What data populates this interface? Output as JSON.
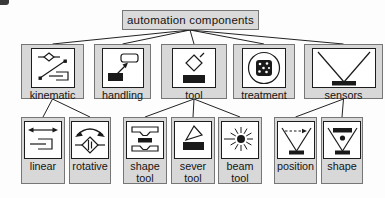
{
  "diagram": {
    "root": {
      "label": "automation components"
    },
    "level1": [
      {
        "id": "kinematic",
        "label": "kinematic",
        "icon": "kinematic-icon"
      },
      {
        "id": "handling",
        "label": "handling",
        "icon": "handling-icon"
      },
      {
        "id": "tool",
        "label": "tool",
        "icon": "tool-icon"
      },
      {
        "id": "treatment",
        "label": "treatment",
        "icon": "treatment-icon"
      },
      {
        "id": "sensors",
        "label": "sensors",
        "icon": "sensors-icon"
      }
    ],
    "level2": [
      {
        "id": "linear",
        "label": "linear",
        "parent": "kinematic",
        "icon": "linear-icon"
      },
      {
        "id": "rotative",
        "label": "rotative",
        "parent": "kinematic",
        "icon": "rotative-icon"
      },
      {
        "id": "shape-tool",
        "label": "shape tool",
        "parent": "tool",
        "icon": "shape-tool-icon"
      },
      {
        "id": "sever-tool",
        "label": "sever tool",
        "parent": "tool",
        "icon": "sever-tool-icon"
      },
      {
        "id": "beam-tool",
        "label": "beam tool",
        "parent": "tool",
        "icon": "beam-tool-icon"
      },
      {
        "id": "position",
        "label": "position",
        "parent": "sensors",
        "icon": "position-sensor-icon"
      },
      {
        "id": "shape",
        "label": "shape",
        "parent": "sensors",
        "icon": "shape-sensor-icon"
      }
    ],
    "colors": {
      "node_fill": "#d8d8d8",
      "node_border": "#767676",
      "icon_bg": "#ffffff",
      "icon_stroke": "#1a1a1a",
      "edge": "#222222",
      "text": "#141414"
    }
  }
}
